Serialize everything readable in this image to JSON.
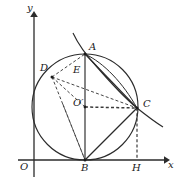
{
  "figure": {
    "background": "#ffffff",
    "stroke": "#2b2b2b",
    "axes": {
      "x_label": "x",
      "y_label": "y",
      "origin_label": "O",
      "x_axis": {
        "x1": 18,
        "y1": 160,
        "x2": 166,
        "y2": 160
      },
      "y_axis": {
        "x1": 34,
        "y1": 176,
        "x2": 34,
        "y2": 14
      }
    },
    "labels": [
      {
        "name": "label-y",
        "text": "y",
        "x": 27,
        "y": 6
      },
      {
        "name": "label-x",
        "text": "x",
        "x": 168,
        "y": 161
      },
      {
        "name": "label-O",
        "text": "O",
        "x": 21,
        "y": 163
      },
      {
        "name": "label-A",
        "text": "A",
        "x": 88,
        "y": 44
      },
      {
        "name": "label-B",
        "text": "B",
        "x": 81,
        "y": 164
      },
      {
        "name": "label-C",
        "text": "C",
        "x": 142,
        "y": 100
      },
      {
        "name": "label-D",
        "text": "D",
        "x": 41,
        "y": 64
      },
      {
        "name": "label-E",
        "text": "E",
        "x": 73,
        "y": 66
      },
      {
        "name": "label-H",
        "text": "H",
        "x": 133,
        "y": 164
      },
      {
        "name": "label-Oprime",
        "text": "O′",
        "x": 74,
        "y": 99
      }
    ],
    "circle": {
      "cx": 85,
      "cy": 107,
      "r": 53
    },
    "points": {
      "A": {
        "x": 85,
        "y": 54
      },
      "B": {
        "x": 85,
        "y": 160
      },
      "C": {
        "x": 137,
        "y": 108
      },
      "D": {
        "x": 52,
        "y": 77
      },
      "E": {
        "x": 85,
        "y": 73
      },
      "H": {
        "x": 137,
        "y": 160
      },
      "Oprime": {
        "x": 85,
        "y": 107
      }
    },
    "solid_segments": [
      {
        "name": "segment-AB",
        "x1": 85,
        "y1": 54,
        "x2": 85,
        "y2": 160
      },
      {
        "name": "segment-AC",
        "x1": 85,
        "y1": 54,
        "x2": 137,
        "y2": 108
      },
      {
        "name": "segment-BC",
        "x1": 85,
        "y1": 160,
        "x2": 137,
        "y2": 108
      }
    ],
    "dashed_segments": [
      {
        "name": "segment-DB",
        "x1": 52,
        "y1": 77,
        "x2": 85,
        "y2": 160
      },
      {
        "name": "segment-DC",
        "x1": 52,
        "y1": 77,
        "x2": 137,
        "y2": 108
      },
      {
        "name": "segment-DOprime",
        "x1": 52,
        "y1": 77,
        "x2": 85,
        "y2": 107
      },
      {
        "name": "segment-OprimeC",
        "x1": 85,
        "y1": 107,
        "x2": 137,
        "y2": 108
      },
      {
        "name": "segment-OprimeB",
        "x1": 85,
        "y1": 107,
        "x2": 85,
        "y2": 160
      },
      {
        "name": "segment-BOprimeD-ray",
        "x1": 85,
        "y1": 160,
        "x2": 52,
        "y2": 77
      },
      {
        "name": "segment-CH",
        "x1": 137,
        "y1": 108,
        "x2": 137,
        "y2": 160
      },
      {
        "name": "segment-DA-chord",
        "x1": 52,
        "y1": 77,
        "x2": 85,
        "y2": 54
      }
    ],
    "curve": {
      "name": "tangent-curve-through-A-and-C",
      "path": "M 73 33 C 79 46, 85 54, 97 67 C 110 82, 125 98, 137 108 C 147 116, 155 122, 162 126"
    },
    "chord_arc": {
      "name": "arc-A-to-C-inner",
      "path": "M 85 54 C 103 62, 122 82, 137 108"
    }
  }
}
